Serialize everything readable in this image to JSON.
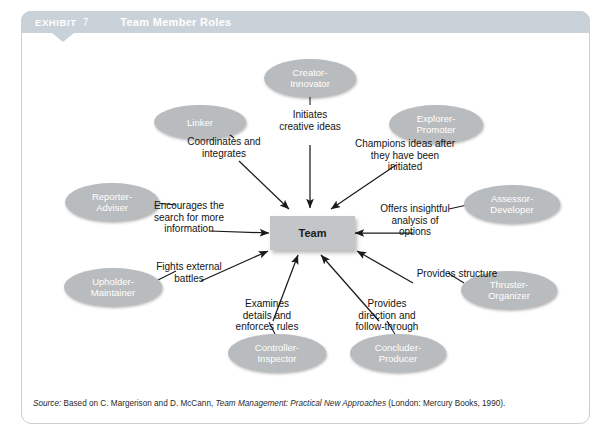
{
  "header": {
    "exhibit_label": "EXHIBIT",
    "exhibit_number": "7",
    "title": "Team Member Roles"
  },
  "center": {
    "label": "Team"
  },
  "roles": [
    {
      "id": "creator-innovator",
      "label": "Creator-\nInnovator"
    },
    {
      "id": "linker",
      "label": "Linker"
    },
    {
      "id": "explorer-promoter",
      "label": "Explorer-\nPromoter"
    },
    {
      "id": "reporter-adviser",
      "label": "Reporter-\nAdviser"
    },
    {
      "id": "assessor-developer",
      "label": "Assessor-\nDeveloper"
    },
    {
      "id": "upholder-maintainer",
      "label": "Upholder-\nMaintainer"
    },
    {
      "id": "thruster-organizer",
      "label": "Thruster-\nOrganizer"
    },
    {
      "id": "controller-inspector",
      "label": "Controller-\nInspector"
    },
    {
      "id": "concluder-producer",
      "label": "Concluder-\nProducer"
    }
  ],
  "captions": [
    {
      "id": "initiates-creative-ideas",
      "text": "Initiates\ncreative ideas"
    },
    {
      "id": "coordinates-and-integrates",
      "text": "Coordinates and\nintegrates"
    },
    {
      "id": "champions-ideas",
      "text": "Champions ideas after\nthey have been\ninitiated"
    },
    {
      "id": "encourages-search",
      "text": "Encourages the\nsearch for more\ninformation"
    },
    {
      "id": "offers-insightful-analysis",
      "text": "Offers insightful\nanalysis of\noptions"
    },
    {
      "id": "fights-external-battles",
      "text": "Fights external\nbattles"
    },
    {
      "id": "provides-structure",
      "text": "Provides structure"
    },
    {
      "id": "examines-details",
      "text": "Examines\ndetails and\nenforces rules"
    },
    {
      "id": "provides-direction",
      "text": "Provides\ndirection and\nfollow-through"
    }
  ],
  "source": {
    "prefix": "Source:",
    "text_1": " Based on C. Margerison and D. McCann, ",
    "italic_1": "Team Management: Practical New Approaches",
    "text_2": " (London: Mercury Books, 1990)."
  },
  "colors": {
    "header_bar": "#c9d2d8",
    "ellipse_fill": "#b9bcbe",
    "team_fill": "#c2c6c9",
    "card_border": "#c9cfd4",
    "text_dark": "#141414"
  }
}
